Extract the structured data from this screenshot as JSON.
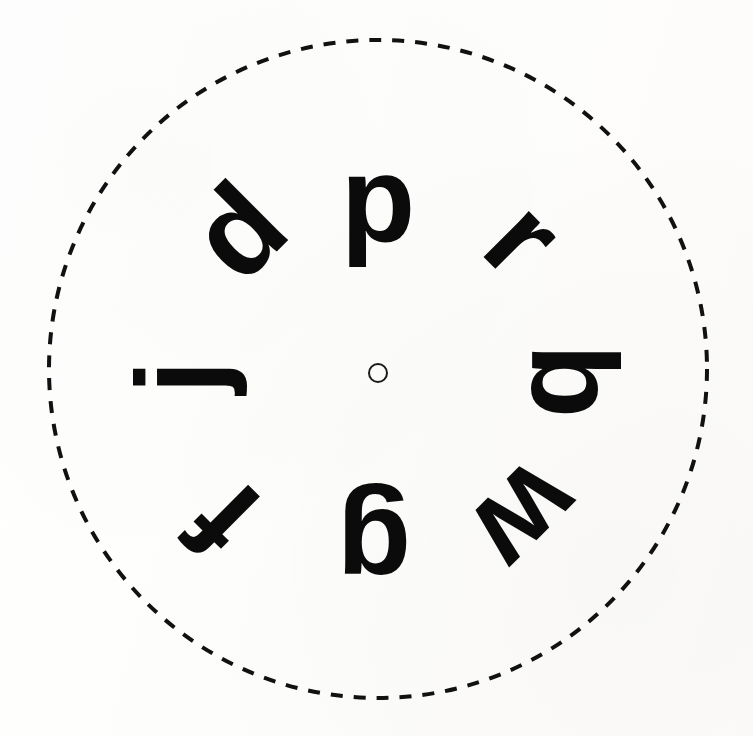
{
  "figure": {
    "background_color": "#fdfdfc",
    "ink_color": "#0b0b0b",
    "width": 753,
    "height": 736
  },
  "boundary_circle": {
    "name": "dashed-boundary-circle",
    "center_x": 378,
    "center_y": 369,
    "radius": 329,
    "stroke_color": "#111111",
    "stroke_width": 4,
    "dash_length": 12,
    "dash_gap": 11,
    "style": "dashed"
  },
  "center_marker": {
    "name": "center-fixation-circle",
    "center_x": 378,
    "center_y": 373,
    "diameter": 20,
    "stroke_color": "#1a1a1a",
    "stroke_width": 2,
    "fill": "none"
  },
  "letters": [
    {
      "id": "letter-p-top",
      "char": "p",
      "clock_position": "12:00",
      "angle_deg": 0,
      "rotation_deg": 0,
      "center_x": 378,
      "center_y": 200,
      "font_size": 122,
      "radius": 173
    },
    {
      "id": "letter-r-upper-right",
      "char": "r",
      "clock_position": "1:30",
      "angle_deg": 45,
      "rotation_deg": 45,
      "center_x": 524,
      "center_y": 238,
      "font_size": 122,
      "radius": 182
    },
    {
      "id": "letter-b-right",
      "char": "b",
      "clock_position": "3:00",
      "angle_deg": 90,
      "rotation_deg": 90,
      "center_x": 574,
      "center_y": 381,
      "font_size": 122,
      "radius": 196
    },
    {
      "id": "letter-w-lower-right",
      "char": "w",
      "clock_position": "4:30",
      "angle_deg": 135,
      "rotation_deg": 135,
      "center_x": 527,
      "center_y": 518,
      "font_size": 122,
      "radius": 201
    },
    {
      "id": "letter-g-bottom",
      "char": "g",
      "clock_position": "6:00",
      "angle_deg": 180,
      "rotation_deg": 180,
      "center_x": 374,
      "center_y": 551,
      "font_size": 122,
      "radius": 182
    },
    {
      "id": "letter-f-lower-left",
      "char": "f",
      "clock_position": "7:30",
      "angle_deg": 225,
      "rotation_deg": 225,
      "center_x": 224,
      "center_y": 520,
      "font_size": 122,
      "radius": 203
    },
    {
      "id": "letter-j-left",
      "char": "j",
      "clock_position": "9:00",
      "angle_deg": 270,
      "rotation_deg": 270,
      "center_x": 180,
      "center_y": 377,
      "font_size": 122,
      "radius": 198
    },
    {
      "id": "letter-d-upper-left",
      "char": "d",
      "clock_position": "10:30",
      "angle_deg": 315,
      "rotation_deg": 315,
      "center_x": 238,
      "center_y": 231,
      "font_size": 122,
      "radius": 196
    }
  ]
}
